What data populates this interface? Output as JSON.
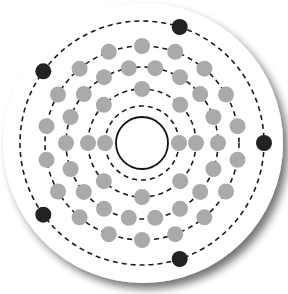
{
  "diagram": {
    "type": "bohr-model-atom",
    "center": [
      142,
      143
    ],
    "disk": {
      "radius": 140,
      "fill": "#ffffff",
      "shadow": "#9a9a9a"
    },
    "nucleus": {
      "radius": 26,
      "fill": "#ffffff",
      "stroke": "#111111"
    },
    "electron_radius": 8,
    "colors": {
      "inner_electron": "#aaaaaa",
      "valence_electron": "#222222",
      "shell_stroke": "#1a1a1a"
    },
    "shells": [
      {
        "n": 1,
        "radius": 37,
        "electron_count": 2,
        "start_angle_deg": 0,
        "valence": false
      },
      {
        "n": 2,
        "radius": 54,
        "electron_count": 8,
        "start_angle_deg": 0,
        "valence": false
      },
      {
        "n": 3,
        "radius": 76,
        "electron_count": 18,
        "start_angle_deg": 0,
        "valence": false
      },
      {
        "n": 4,
        "radius": 97,
        "electron_count": 18,
        "start_angle_deg": 10,
        "valence": false
      },
      {
        "n": 5,
        "radius": 122,
        "electron_count": 5,
        "start_angle_deg": 0,
        "valence": true
      }
    ],
    "electron_configuration": [
      2,
      8,
      18,
      18,
      5
    ],
    "total_electrons": 51
  }
}
